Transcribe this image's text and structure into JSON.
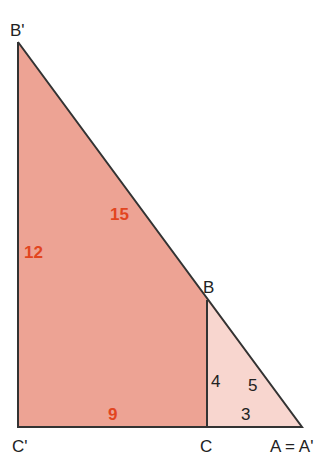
{
  "diagram": {
    "colors": {
      "large_fill": "#eda394",
      "small_fill": "#f8d6cf",
      "stroke": "#333333",
      "red_label": "#e2451f",
      "dark_label": "#222222"
    },
    "vertices": {
      "B_prime": "B'",
      "C_prime": "C'",
      "C": "C",
      "B": "B",
      "A": "A = A'"
    },
    "large_triangle": {
      "vertical_leg": "12",
      "hypotenuse": "15",
      "horizontal_leg": "9"
    },
    "small_triangle": {
      "vertical_leg": "4",
      "hypotenuse": "5",
      "horizontal_leg": "3"
    }
  }
}
